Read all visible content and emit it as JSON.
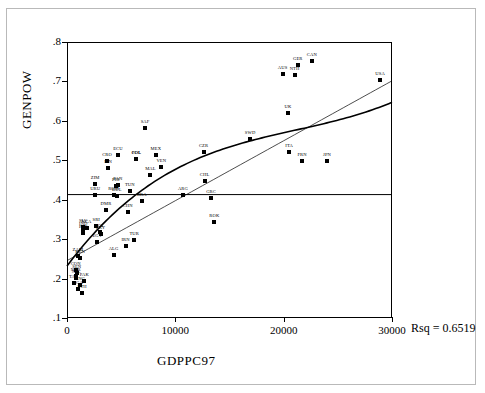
{
  "chart_data": {
    "type": "scatter",
    "title": "",
    "xlabel": "GDPPC97",
    "ylabel": "GENPOW",
    "xlim": [
      0,
      30000
    ],
    "ylim": [
      0.1,
      0.8
    ],
    "xticks": [
      "0",
      "10000",
      "20000",
      "30000"
    ],
    "xtick_values": [
      0,
      10000,
      20000,
      30000
    ],
    "yticks": [
      ".1",
      ".2",
      ".3",
      ".4",
      ".5",
      ".6",
      ".7",
      ".8"
    ],
    "ytick_values": [
      0.1,
      0.2,
      0.3,
      0.4,
      0.5,
      0.6,
      0.7,
      0.8
    ],
    "grid": false,
    "annotation": "Rsq = 0.6519",
    "rsq": 0.6519,
    "reference_line_y": 0.413,
    "fit_lines": [
      {
        "name": "linear-fit",
        "type": "line"
      },
      {
        "name": "cubic-fit",
        "type": "curve"
      },
      {
        "name": "mean-reference",
        "type": "horizontal",
        "y": 0.413
      }
    ],
    "points": [
      {
        "label": "GER",
        "x": 21300,
        "y": 0.742
      },
      {
        "label": "CAN",
        "x": 22600,
        "y": 0.752
      },
      {
        "label": "AUS",
        "x": 19900,
        "y": 0.718
      },
      {
        "label": "NTH",
        "x": 21000,
        "y": 0.716
      },
      {
        "label": "USA",
        "x": 28900,
        "y": 0.703
      },
      {
        "label": "UK",
        "x": 20400,
        "y": 0.619
      },
      {
        "label": "SAF",
        "x": 7200,
        "y": 0.583
      },
      {
        "label": "SWD",
        "x": 16900,
        "y": 0.555
      },
      {
        "label": "ITA",
        "x": 20500,
        "y": 0.522
      },
      {
        "label": "CZR",
        "x": 12600,
        "y": 0.52
      },
      {
        "label": "MEX",
        "x": 8200,
        "y": 0.513
      },
      {
        "label": "ECU",
        "x": 4700,
        "y": 0.513
      },
      {
        "label": "COL",
        "x": 6400,
        "y": 0.504
      },
      {
        "label": "POL",
        "x": 6400,
        "y": 0.504
      },
      {
        "label": "FRN",
        "x": 21700,
        "y": 0.497
      },
      {
        "label": "JPN",
        "x": 24000,
        "y": 0.497
      },
      {
        "label": "CRO",
        "x": 3700,
        "y": 0.497
      },
      {
        "label": "VEN",
        "x": 8700,
        "y": 0.484
      },
      {
        "label": "FIN",
        "x": 3800,
        "y": 0.481
      },
      {
        "label": "MAL",
        "x": 7700,
        "y": 0.462
      },
      {
        "label": "CHL",
        "x": 12700,
        "y": 0.447
      },
      {
        "label": "ZIM",
        "x": 2600,
        "y": 0.44
      },
      {
        "label": "PAN",
        "x": 4700,
        "y": 0.438
      },
      {
        "label": "PHI",
        "x": 4500,
        "y": 0.436
      },
      {
        "label": "TUN",
        "x": 5800,
        "y": 0.423
      },
      {
        "label": "URU",
        "x": 2600,
        "y": 0.413
      },
      {
        "label": "ARG",
        "x": 10700,
        "y": 0.413
      },
      {
        "label": "GRC",
        "x": 13300,
        "y": 0.405
      },
      {
        "label": "ROM",
        "x": 4300,
        "y": 0.412
      },
      {
        "label": "BUL",
        "x": 4600,
        "y": 0.41
      },
      {
        "label": "BRA",
        "x": 6900,
        "y": 0.398
      },
      {
        "label": "DMR",
        "x": 3600,
        "y": 0.374
      },
      {
        "label": "CHN",
        "x": 5600,
        "y": 0.369
      },
      {
        "label": "ROK",
        "x": 13600,
        "y": 0.343
      },
      {
        "label": "SRI",
        "x": 2700,
        "y": 0.334
      },
      {
        "label": "SLV",
        "x": 1500,
        "y": 0.331
      },
      {
        "label": "NCA",
        "x": 1800,
        "y": 0.328
      },
      {
        "label": "IND",
        "x": 1500,
        "y": 0.322
      },
      {
        "label": "BOL",
        "x": 3000,
        "y": 0.319
      },
      {
        "label": "PER",
        "x": 1500,
        "y": 0.316
      },
      {
        "label": "PRY",
        "x": 3100,
        "y": 0.314
      },
      {
        "label": "TUR",
        "x": 6200,
        "y": 0.297
      },
      {
        "label": "EGY",
        "x": 2800,
        "y": 0.292
      },
      {
        "label": "IRN",
        "x": 5400,
        "y": 0.282
      },
      {
        "label": "ALG",
        "x": 4300,
        "y": 0.261
      },
      {
        "label": "ZAM",
        "x": 1000,
        "y": 0.256
      },
      {
        "label": "KEN",
        "x": 1200,
        "y": 0.251
      },
      {
        "label": "CON",
        "x": 800,
        "y": 0.221
      },
      {
        "label": "SEN",
        "x": 900,
        "y": 0.213
      },
      {
        "label": "NGR",
        "x": 800,
        "y": 0.206
      },
      {
        "label": "NPL",
        "x": 850,
        "y": 0.201
      },
      {
        "label": "PAK",
        "x": 1600,
        "y": 0.194
      },
      {
        "label": "TAZ",
        "x": 600,
        "y": 0.188
      },
      {
        "label": "BNG",
        "x": 1200,
        "y": 0.183
      },
      {
        "label": "UGA",
        "x": 1000,
        "y": 0.173
      },
      {
        "label": "ETH",
        "x": 1400,
        "y": 0.163
      }
    ]
  }
}
